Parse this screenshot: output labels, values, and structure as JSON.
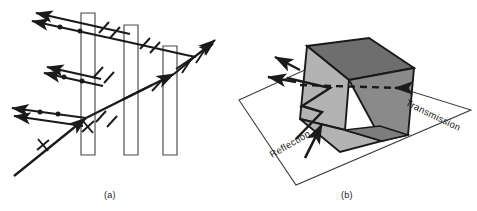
{
  "figure": {
    "background_color": "#ffffff",
    "stroke_color": "#1a1a1a",
    "width": 477,
    "height": 211
  },
  "panels": [
    {
      "id": "a",
      "caption": "(a)",
      "description": "Pile-of-plates polarizer: an unpolarized incident ray strikes a stack of three parallel plates; partially polarized rays are reflected at each surface and the transmitted ray becomes linearly polarized.",
      "plates": [
        {
          "name": "plate-1",
          "label": ""
        },
        {
          "name": "plate-2",
          "label": ""
        },
        {
          "name": "plate-3",
          "label": ""
        }
      ],
      "markers": {
        "dot_marker": "electric-field-perpendicular-dot",
        "tick_marker": "electric-field-parallel-tick"
      },
      "rays": [
        {
          "name": "incident-ray",
          "type": "incident",
          "polarization": "unpolarized"
        },
        {
          "name": "reflected-ray-1",
          "type": "reflected",
          "polarization": "perpendicular"
        },
        {
          "name": "reflected-ray-2",
          "type": "reflected",
          "polarization": "perpendicular"
        },
        {
          "name": "reflected-ray-3",
          "type": "reflected",
          "polarization": "perpendicular"
        },
        {
          "name": "transmitted-ray",
          "type": "transmitted",
          "polarization": "parallel"
        }
      ]
    },
    {
      "id": "b",
      "caption": "(b)",
      "description": "Three-dimensional view of a rectangular block on a plane of incidence showing reflected and transmitted beams.",
      "labels": {
        "transmission": "Transmission",
        "reflection": "Reflection"
      },
      "prism": {
        "top_face_color": "#6e6e6e",
        "front_face_color": "#b3b3b3",
        "side_face_color": "#8a8a8a",
        "bevel_face_color": "#7d7d7d",
        "edge_color": "#1a1a1a"
      },
      "plane": {
        "name": "plane-of-incidence",
        "fill": "#ffffff",
        "stroke": "#3a3a3a"
      },
      "transmission_line_style": "dashed",
      "arrows": [
        {
          "name": "reflection-arrow",
          "label": "Reflection"
        },
        {
          "name": "reflected-beam-upper",
          "label": ""
        },
        {
          "name": "reflected-beam-lower",
          "label": ""
        },
        {
          "name": "transmission-arrow",
          "label": "Transmission"
        }
      ]
    }
  ]
}
